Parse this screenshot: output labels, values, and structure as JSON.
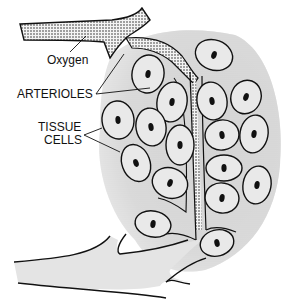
{
  "diagram": {
    "type": "anatomical illustration",
    "labels": {
      "oxygen": "Oxygen",
      "arterioles": "ARTERIOLES",
      "tissue_line1": "TISSUE",
      "tissue_line2": "CELLS"
    },
    "colors": {
      "outline": "#111111",
      "stipple": "#555555",
      "tissue_shading": "#d9d9d9",
      "nucleus": "#111111",
      "background": "#ffffff"
    },
    "cells": [
      {
        "cx": 214,
        "cy": 55,
        "rx": 19,
        "ry": 15,
        "rot": 20
      },
      {
        "cx": 148,
        "cy": 74,
        "rx": 16,
        "ry": 19,
        "rot": 10
      },
      {
        "cx": 172,
        "cy": 102,
        "rx": 15,
        "ry": 20,
        "rot": 10
      },
      {
        "cx": 212,
        "cy": 101,
        "rx": 15,
        "ry": 19,
        "rot": -10
      },
      {
        "cx": 246,
        "cy": 97,
        "rx": 15,
        "ry": 17,
        "rot": 20
      },
      {
        "cx": 118,
        "cy": 120,
        "rx": 16,
        "ry": 19,
        "rot": -5
      },
      {
        "cx": 151,
        "cy": 127,
        "rx": 15,
        "ry": 19,
        "rot": -10
      },
      {
        "cx": 180,
        "cy": 145,
        "rx": 14,
        "ry": 20,
        "rot": 0
      },
      {
        "cx": 222,
        "cy": 135,
        "rx": 17,
        "ry": 15,
        "rot": -10
      },
      {
        "cx": 254,
        "cy": 134,
        "rx": 14,
        "ry": 19,
        "rot": 10
      },
      {
        "cx": 136,
        "cy": 163,
        "rx": 14,
        "ry": 19,
        "rot": -20
      },
      {
        "cx": 170,
        "cy": 183,
        "rx": 18,
        "ry": 15,
        "rot": 20
      },
      {
        "cx": 224,
        "cy": 168,
        "rx": 18,
        "ry": 13,
        "rot": 0
      },
      {
        "cx": 257,
        "cy": 185,
        "rx": 14,
        "ry": 19,
        "rot": 10
      },
      {
        "cx": 222,
        "cy": 198,
        "rx": 17,
        "ry": 15,
        "rot": 10
      },
      {
        "cx": 153,
        "cy": 224,
        "rx": 18,
        "ry": 13,
        "rot": 10
      },
      {
        "cx": 217,
        "cy": 243,
        "rx": 17,
        "ry": 13,
        "rot": -15
      }
    ]
  }
}
